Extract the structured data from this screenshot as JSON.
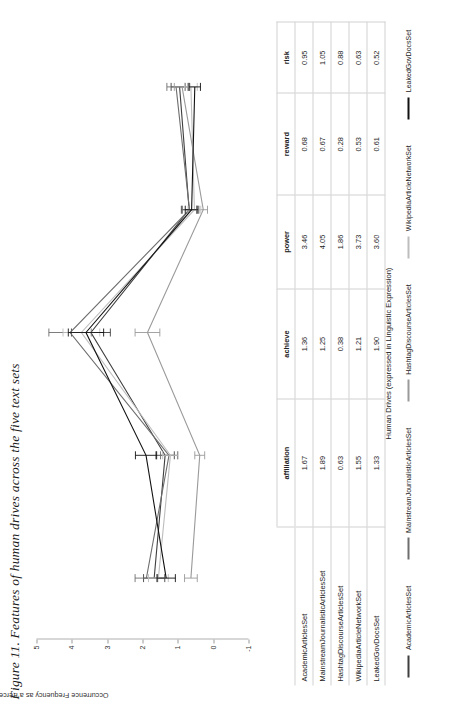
{
  "figure": {
    "caption": "Figure 11. Features of human drives across the five text sets"
  },
  "chart_data": {
    "type": "line",
    "title": "Figure 11. Features of human drives across the five text sets",
    "xlabel": "Human Drives (expressed in Linguistic Expression)",
    "ylabel": "Occurrence Frequency as a Percentage",
    "categories": [
      "affiliation",
      "achieve",
      "power",
      "reward",
      "risk"
    ],
    "ylim": [
      -1,
      5
    ],
    "yticks": [
      "5",
      "4",
      "3",
      "2",
      "1",
      "0",
      "-1"
    ],
    "grid": false,
    "legend_position": "bottom",
    "error_bars": true,
    "series": [
      {
        "name": "AcademicArticlesSet",
        "color": "#3f3f3f",
        "values": [
          1.67,
          1.36,
          3.46,
          0.68,
          0.95
        ],
        "errors": [
          0.3,
          0.26,
          0.55,
          0.22,
          0.24
        ]
      },
      {
        "name": "MainstreamJournalisticArticlesSet",
        "color": "#6e6e6e",
        "values": [
          1.89,
          1.25,
          4.05,
          0.67,
          1.05
        ],
        "errors": [
          0.32,
          0.24,
          0.6,
          0.2,
          0.26
        ]
      },
      {
        "name": "HashtagDiscourseArticlesSet",
        "color": "#9a9a9a",
        "values": [
          0.63,
          0.38,
          1.86,
          0.28,
          0.88
        ],
        "errors": [
          0.18,
          0.14,
          0.35,
          0.12,
          0.22
        ]
      },
      {
        "name": "WikipediaArticleNetworkSet",
        "color": "#bdbdbd",
        "values": [
          1.55,
          1.21,
          3.73,
          0.53,
          0.63
        ],
        "errors": [
          0.28,
          0.22,
          0.52,
          0.18,
          0.18
        ]
      },
      {
        "name": "LeakedGovDocsSet",
        "color": "#111111",
        "values": [
          1.33,
          1.9,
          3.6,
          0.61,
          0.52
        ],
        "errors": [
          0.26,
          0.3,
          0.5,
          0.18,
          0.16
        ]
      }
    ]
  },
  "table": {
    "columns": [
      "",
      "affiliation",
      "achieve",
      "power",
      "reward",
      "risk"
    ],
    "rows": [
      {
        "label": "AcademicArticlesSet",
        "values": [
          "1.67",
          "1.36",
          "3.46",
          "0.68",
          "0.95"
        ]
      },
      {
        "label": "MainstreamJournalisticArticlesSet",
        "values": [
          "1.89",
          "1.25",
          "4.05",
          "0.67",
          "1.05"
        ]
      },
      {
        "label": "HashtagDiscourseArticlesSet",
        "values": [
          "0.63",
          "0.38",
          "1.86",
          "0.28",
          "0.88"
        ]
      },
      {
        "label": "WikipediaArticleNetworkSet",
        "values": [
          "1.55",
          "1.21",
          "3.73",
          "0.53",
          "0.63"
        ]
      },
      {
        "label": "LeakedGovDocsSet",
        "values": [
          "1.33",
          "1.90",
          "3.60",
          "0.61",
          "0.52"
        ]
      }
    ]
  },
  "legend": {
    "items": [
      {
        "label": "AcademicArticlesSet",
        "color": "#3f3f3f"
      },
      {
        "label": "MainstreamJournalisticArticlesSet",
        "color": "#6e6e6e"
      },
      {
        "label": "HashtagDiscourseArticlesSet",
        "color": "#9a9a9a"
      },
      {
        "label": "WikipediaArticleNetworkSet",
        "color": "#bdbdbd"
      },
      {
        "label": "LeakedGovDocsSet",
        "color": "#111111"
      }
    ]
  }
}
